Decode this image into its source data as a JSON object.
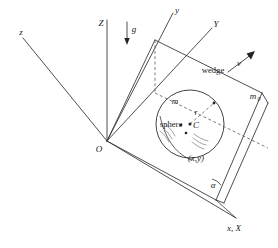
{
  "figure": {
    "kind": "physics-mechanics-diagram",
    "background_color": "#ffffff",
    "line_color": "#3a3a3a",
    "dashed_color": "#5a5a5a",
    "hatch_color": "#7a7a7a"
  },
  "labels": {
    "origin": "O",
    "axis_z_lower": "z",
    "axis_Z_upper": "Z",
    "axis_y_lower": "y",
    "axis_Y_upper": "Y",
    "axis_x_X": "x, X",
    "gravity": "g",
    "velocity": "v",
    "wedge": "wedge",
    "sphere": "sphere",
    "center": "C",
    "radius": "r",
    "contact_point": "(x,y)",
    "mass_sphere": "m",
    "mass_wedge_base": "m",
    "mass_wedge_sub": "0",
    "angle": "α"
  },
  "geometry": {
    "origin_point": [
      107,
      141
    ],
    "sphere_center": [
      190,
      124
    ],
    "sphere_radius": 34,
    "incline_angle_label": "α"
  }
}
